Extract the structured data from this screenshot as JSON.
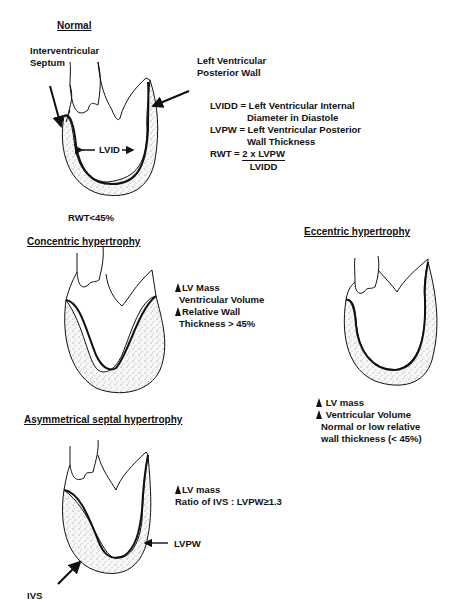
{
  "normal": {
    "title": "Normal",
    "septum_label_line1": "Interventricular",
    "septum_label_line2": "Septum",
    "posterior_label_line1": "Left Ventricular",
    "posterior_label_line2": "Posterior Wall",
    "lvid_label": "LVID",
    "rwt_label": "RWT<45%",
    "definitions": {
      "lvidd_line1": "LVIDD = Left Ventricular Internal",
      "lvidd_line2": "Diameter in Diastole",
      "lvpw_line1": "LVPW = Left Ventricular Posterior",
      "lvpw_line2": "Wall Thickness",
      "rwt_prefix": "RWT = ",
      "rwt_numerator": "2 x LVPW",
      "rwt_denominator": "LVIDD"
    }
  },
  "concentric": {
    "title": "Concentric hypertrophy",
    "line1": "LV Mass",
    "line2": "Ventricular Volume",
    "line3": "Relative Wall",
    "line4": "Thickness > 45%"
  },
  "eccentric": {
    "title": "Eccentric hypertrophy",
    "line1": "LV mass",
    "line2": "Ventricular Volume",
    "line3": "Normal or low relative",
    "line4": "wall thickness (< 45%)"
  },
  "asymmetrical": {
    "title": "Asymmetrical septal hypertrophy",
    "line1": "LV mass",
    "line2": "Ratio of IVS : LVPW≥1.3",
    "lvpw_label": "LVPW",
    "ivs_label": "IVS"
  }
}
